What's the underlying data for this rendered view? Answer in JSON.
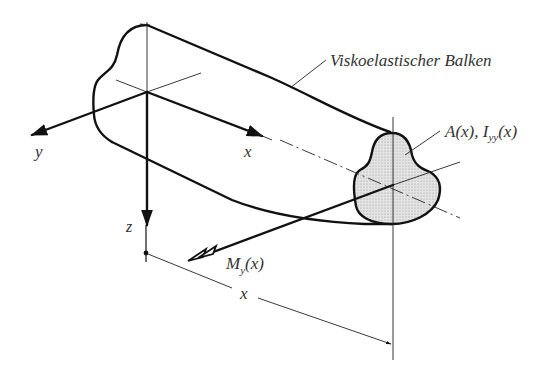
{
  "diagram": {
    "title_label": "Viskoelastischer Balken",
    "section_label_A": "A(x), ",
    "section_label_I": "I",
    "section_label_I_sub": "yy",
    "section_label_I_arg": "(x)",
    "moment_label_M": "M",
    "moment_label_sub": "y",
    "moment_label_arg": "(x)",
    "axis_y": "y",
    "axis_x": "x",
    "axis_z": "z",
    "dimension_x": "x",
    "colors": {
      "line": "#111111",
      "section_fill": "#dcdcdc",
      "text": "#333333"
    }
  }
}
